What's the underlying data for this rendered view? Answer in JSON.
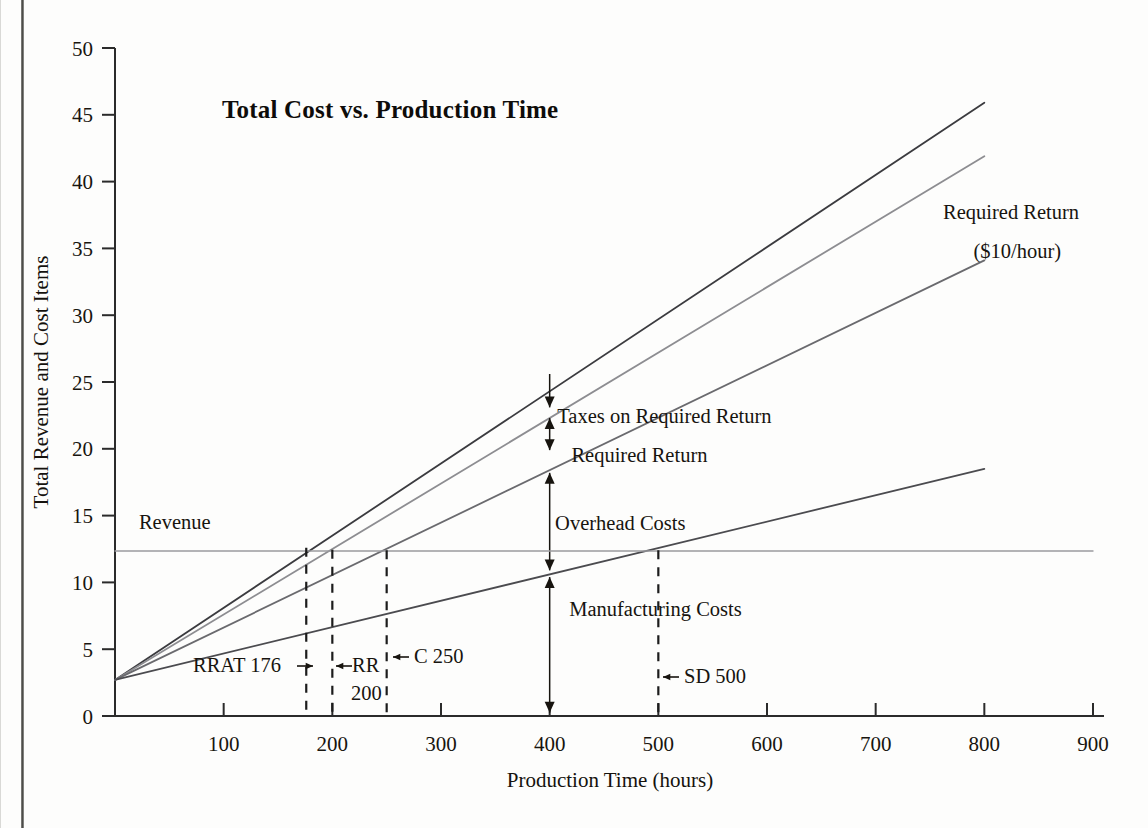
{
  "figure": {
    "title": "Total Cost vs. Production Time",
    "background_color": "#fdfdfc",
    "ink_color": "#17140f"
  },
  "chart_data": {
    "type": "line",
    "title": "Total Cost vs. Production Time",
    "xlabel": "Production Time (hours)",
    "ylabel": "Total Revenue and Cost Items",
    "xlim": [
      0,
      900
    ],
    "ylim": [
      0,
      50
    ],
    "xticks": [
      0,
      100,
      200,
      300,
      400,
      500,
      600,
      700,
      800,
      900
    ],
    "yticks": [
      0,
      5,
      10,
      15,
      20,
      25,
      30,
      35,
      40,
      45,
      50
    ],
    "xtick_labels": [
      "0",
      "100",
      "200",
      "300",
      "400",
      "500",
      "600",
      "700",
      "800",
      "900"
    ],
    "ytick_labels": [
      "0",
      "5",
      "10",
      "15",
      "20",
      "25",
      "30",
      "35",
      "40",
      "45",
      "50"
    ],
    "grid": false,
    "legend": "none",
    "series": [
      {
        "name": "Total cost incl. taxes on required return",
        "color": "#3b3b3f",
        "width": 1.8,
        "x": [
          0,
          800
        ],
        "y": [
          2.7,
          45.9
        ]
      },
      {
        "name": "Total cost incl. required return",
        "color": "#8d8d91",
        "width": 1.8,
        "x": [
          0,
          800
        ],
        "y": [
          2.7,
          41.9
        ]
      },
      {
        "name": "Overhead plus manufacturing costs",
        "color": "#6a6a6e",
        "width": 1.8,
        "x": [
          0,
          800
        ],
        "y": [
          2.7,
          34.1
        ]
      },
      {
        "name": "Manufacturing costs",
        "color": "#4b4b4f",
        "width": 1.8,
        "x": [
          0,
          800
        ],
        "y": [
          2.7,
          18.5
        ]
      },
      {
        "name": "Revenue",
        "color": "#9a9a9e",
        "width": 1.4,
        "x": [
          0,
          900
        ],
        "y": [
          12.35,
          12.35
        ]
      }
    ],
    "vertical_markers": [
      {
        "label": "RRAT 176",
        "x": 176,
        "y_top": 12.6
      },
      {
        "label": "RR 200",
        "x": 200,
        "y_top": 12.45
      },
      {
        "label": "C 250",
        "x": 250,
        "y_top": 12.4
      },
      {
        "label": "SD 500",
        "x": 500,
        "y_top": 12.4
      }
    ],
    "annotations": [
      {
        "name": "revenue",
        "text": "Revenue",
        "x": 22,
        "y": 14.0
      },
      {
        "name": "overhead-costs",
        "text": "Overhead Costs",
        "x": 405,
        "y": 13.9
      },
      {
        "name": "taxes-on-required-return",
        "text": "Taxes on Required Return",
        "x": 407,
        "y": 21.9
      },
      {
        "name": "required-return-band",
        "text": "Required Return",
        "x": 420,
        "y": 19.0
      },
      {
        "name": "manufacturing-costs",
        "text": "Manufacturing Costs",
        "x": 418,
        "y": 7.5
      },
      {
        "name": "required-return-line",
        "text": "Required Return",
        "x": 762,
        "y": 37.2
      },
      {
        "name": "required-return-rate",
        "text": "($10/hour)",
        "x": 790,
        "y": 34.3
      }
    ],
    "marker_labels": [
      {
        "name": "rrat-176",
        "text": "RRAT 176",
        "arrow": "right"
      },
      {
        "name": "rr-200",
        "text": "RR",
        "text2": "200",
        "arrow": "left"
      },
      {
        "name": "c-250",
        "text": "C 250",
        "arrow": "left"
      },
      {
        "name": "sd-500",
        "text": "SD 500",
        "arrow": "left"
      }
    ],
    "measure_arrow": {
      "name": "cost-breakdown-arrow",
      "x": 400,
      "segments": [
        {
          "from": 0.0,
          "to": 10.7,
          "label": "Manufacturing Costs"
        },
        {
          "from": 10.7,
          "to": 12.35,
          "label": "Overhead Costs"
        },
        {
          "from": 18.0,
          "to": 20.0,
          "label": "Required Return"
        },
        {
          "from": 20.0,
          "to": 23.2,
          "label": "Taxes on Required Return"
        }
      ]
    }
  }
}
